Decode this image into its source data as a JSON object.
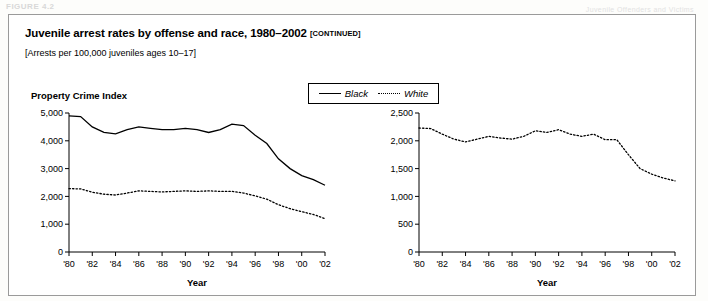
{
  "page": {
    "header_artifact": "FIGURE 4.2",
    "header_artifact_right": "Juvenile Offenders and Victims"
  },
  "figure": {
    "title": "Juvenile arrest rates by offense and race, 1980–2002",
    "title_continued": "[CONTINUED]",
    "subtitle": "[Arrests per 100,000 juveniles ages 10–17]",
    "section_heading": "Property Crime Index"
  },
  "legend": {
    "position": "top-center",
    "items": [
      {
        "label": "Black",
        "style": "solid",
        "color": "#000000"
      },
      {
        "label": "White",
        "style": "dotted",
        "color": "#000000"
      }
    ]
  },
  "chart_data": [
    {
      "type": "line",
      "id": "property-crime-index-black",
      "title": "Property Crime Index",
      "xlabel": "Year",
      "ylabel": "",
      "grid": false,
      "legend": "top-center",
      "xlim": [
        1980,
        2002
      ],
      "ylim": [
        0,
        5000
      ],
      "yticks": [
        0,
        1000,
        2000,
        3000,
        4000,
        5000
      ],
      "ytick_labels": [
        "0",
        "1,000",
        "2,000",
        "3,000",
        "4,000",
        "5,000"
      ],
      "xticks": [
        1980,
        1982,
        1984,
        1986,
        1988,
        1990,
        1992,
        1994,
        1996,
        1998,
        2000,
        2002
      ],
      "xtick_labels": [
        "'80",
        "'82",
        "'84",
        "'86",
        "'88",
        "'90",
        "'92",
        "'94",
        "'96",
        "'98",
        "'00",
        "'02"
      ],
      "x": [
        1980,
        1981,
        1982,
        1983,
        1984,
        1985,
        1986,
        1987,
        1988,
        1989,
        1990,
        1991,
        1992,
        1993,
        1994,
        1995,
        1996,
        1997,
        1998,
        1999,
        2000,
        2001,
        2002
      ],
      "series": [
        {
          "name": "Black",
          "style": "solid",
          "values": [
            4900,
            4870,
            4500,
            4300,
            4250,
            4400,
            4500,
            4450,
            4400,
            4400,
            4450,
            4400,
            4300,
            4400,
            4600,
            4550,
            4200,
            3900,
            3350,
            3000,
            2750,
            2600,
            2400
          ]
        },
        {
          "name": "White",
          "style": "dotted",
          "values": [
            2280,
            2270,
            2150,
            2080,
            2050,
            2120,
            2200,
            2180,
            2160,
            2180,
            2200,
            2180,
            2200,
            2180,
            2180,
            2120,
            2020,
            1900,
            1700,
            1560,
            1450,
            1350,
            1200
          ]
        }
      ]
    },
    {
      "type": "line",
      "id": "property-crime-index-right",
      "title": "",
      "xlabel": "Year",
      "ylabel": "",
      "grid": false,
      "xlim": [
        1980,
        2002
      ],
      "ylim": [
        0,
        2500
      ],
      "yticks": [
        0,
        500,
        1000,
        1500,
        2000,
        2500
      ],
      "ytick_labels": [
        "0",
        "500",
        "1,000",
        "1,500",
        "2,000",
        "2,500"
      ],
      "xticks": [
        1980,
        1982,
        1984,
        1986,
        1988,
        1990,
        1992,
        1994,
        1996,
        1998,
        2000,
        2002
      ],
      "xtick_labels": [
        "'80",
        "'82",
        "'84",
        "'86",
        "'88",
        "'90",
        "'92",
        "'94",
        "'96",
        "'98",
        "'00",
        "'02"
      ],
      "x": [
        1980,
        1981,
        1982,
        1983,
        1984,
        1985,
        1986,
        1987,
        1988,
        1989,
        1990,
        1991,
        1992,
        1993,
        1994,
        1995,
        1996,
        1997,
        1998,
        1999,
        2000,
        2001,
        2002
      ],
      "series": [
        {
          "name": "White",
          "style": "dotted",
          "values": [
            2230,
            2220,
            2120,
            2030,
            1980,
            2030,
            2080,
            2050,
            2030,
            2080,
            2180,
            2150,
            2200,
            2120,
            2080,
            2120,
            2020,
            2020,
            1750,
            1500,
            1400,
            1330,
            1280
          ]
        }
      ]
    }
  ]
}
